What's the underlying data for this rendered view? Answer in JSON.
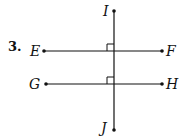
{
  "problem_number": "3.",
  "points": {
    "E": "E",
    "F": "F",
    "G": "G",
    "H": "H",
    "I": "I",
    "J": "J"
  },
  "figure": {
    "transversal": "IJ",
    "lines": [
      "EF",
      "GH"
    ],
    "right_angle_marks": 2
  }
}
